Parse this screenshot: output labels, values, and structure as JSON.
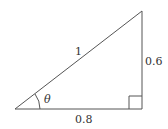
{
  "diagram": {
    "type": "right-triangle",
    "hypotenuse_label": "1",
    "opposite_label": "0.6",
    "adjacent_label": "0.8",
    "angle_label": "θ",
    "colors": {
      "stroke": "#555555",
      "text": "#333333",
      "background": "#ffffff"
    }
  }
}
